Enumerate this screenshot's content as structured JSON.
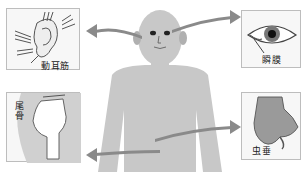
{
  "diagram": {
    "colors": {
      "figure": "#c8c8c8",
      "arrow": "#8a8a8a",
      "panel_border": "#bdbdbd",
      "panel_bg": "#f7f7f7",
      "text": "#222222"
    },
    "panels": [
      {
        "id": "ear-muscle",
        "label": "動耳筋",
        "position": "top-left"
      },
      {
        "id": "nictitating-membrane",
        "label": "瞬膜",
        "position": "top-right"
      },
      {
        "id": "tailbone",
        "label": "尾骨",
        "position": "bottom-left"
      },
      {
        "id": "appendix",
        "label": "虫垂",
        "position": "bottom-right"
      }
    ]
  }
}
